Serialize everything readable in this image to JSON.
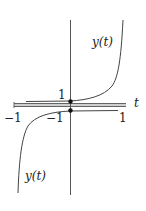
{
  "figure": {
    "type": "function-plot",
    "curve_color": "#444444",
    "axis_color": "#555555",
    "band_color": "#9a9a9a",
    "labels": {
      "y_tick_1": "1",
      "x_axis": "t",
      "x_tick_neg1": "−1",
      "y_tick_neg1": "−1",
      "x_tick_1": "1",
      "upper_curve": "y(t)",
      "lower_curve": "y(t)"
    },
    "points": [
      {
        "name": "intercept-1",
        "t": 0,
        "y": 1
      },
      {
        "name": "intercept-neg1",
        "t": 0,
        "y": -1
      }
    ]
  }
}
